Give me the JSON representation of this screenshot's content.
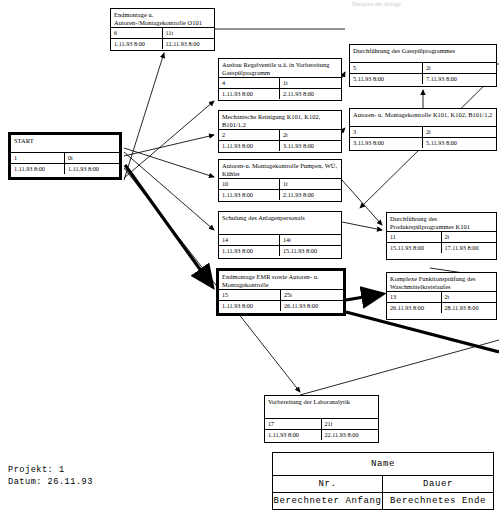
{
  "page": {
    "top_note": "Netzplan der Anlage",
    "project_label": "Projekt: 1",
    "date_label": "Datum: 26.11.93"
  },
  "legend": {
    "name": "Name",
    "nr": "Nr.",
    "dauer": "Dauer",
    "start": "Berechneter Anfang",
    "end": "Berechnetes Ende"
  },
  "nodes": [
    {
      "id": "start",
      "name": "START",
      "nr": "1",
      "dauer": "0t",
      "start": "1.11.93 8:00",
      "end": "1.11.93 8:00",
      "bold": true,
      "x": 8,
      "y": 132,
      "w": 114,
      "h": 48
    },
    {
      "id": "endmontage-o101",
      "name": "Endmontage u. Autoren-/Montagekontrolle O101",
      "nr": "6",
      "dauer": "11t",
      "start": "1.11.93 8:00",
      "end": "12.11.93 8:00",
      "bold": false,
      "x": 110,
      "y": 8,
      "w": 105,
      "h": 43
    },
    {
      "id": "ausbau-regelventile",
      "name": "Ausbau Regelventile u.ä. in Vorbereitung Gasspülprogramm",
      "nr": "4",
      "dauer": "1t",
      "start": "1.11.93 8:00",
      "end": "2.11.93 8:00",
      "bold": false,
      "x": 218,
      "y": 58,
      "w": 124,
      "h": 43
    },
    {
      "id": "mech-reinigung",
      "name": "Mechanische Reinigung K101, K102, B101/1,2",
      "nr": "2",
      "dauer": "2t",
      "start": "1.11.93 8:00",
      "end": "3.11.93 8:00",
      "bold": false,
      "x": 218,
      "y": 110,
      "w": 124,
      "h": 43
    },
    {
      "id": "autoren-pumpen",
      "name": "Autoren-u. Montagekontrolle Pumpen, WÜ, Kühler",
      "nr": "10",
      "dauer": "1t",
      "start": "1.11.93 8:00",
      "end": "2.11.93 8:00",
      "bold": false,
      "x": 218,
      "y": 159,
      "w": 124,
      "h": 43
    },
    {
      "id": "schulung",
      "name": "Schulung des Anlagenpersonals",
      "nr": "14",
      "dauer": "14t",
      "start": "1.11.93 8:00",
      "end": "15.11.93 8:00",
      "bold": false,
      "x": 218,
      "y": 211,
      "w": 124,
      "h": 48
    },
    {
      "id": "endmontage-emr",
      "name": "Endmontage EMR sowie Autoren- u. Montagekontrolle",
      "nr": "15",
      "dauer": "25t",
      "start": "1.11.93 8:00",
      "end": "26.11.93 8:00",
      "bold": true,
      "x": 216,
      "y": 268,
      "w": 130,
      "h": 48
    },
    {
      "id": "vorbereitung-labor",
      "name": "Vorbereitung der Laboranalytik",
      "nr": "17",
      "dauer": "21t",
      "start": "1.11.93 8:00",
      "end": "22.11.93 8:00",
      "bold": false,
      "x": 264,
      "y": 395,
      "w": 115,
      "h": 48
    },
    {
      "id": "durchf-gasspuel",
      "name": "Durchführung des Gasspülprogrammes",
      "nr": "5",
      "dauer": "2t",
      "start": "5.11.93 8:00",
      "end": "7.11.93 8:00",
      "bold": false,
      "x": 349,
      "y": 44,
      "w": 148,
      "h": 43
    },
    {
      "id": "autoren-k101",
      "name": "Autoren- u. Montagekontrolle K101, K102, B101/1,2",
      "nr": "3",
      "dauer": "2t",
      "start": "3.11.93 8:00",
      "end": "5.11.93 8:00",
      "bold": false,
      "x": 349,
      "y": 108,
      "w": 148,
      "h": 43
    },
    {
      "id": "durchf-produktspuel",
      "name": "Durchführung des Produktspülprogrammes K101",
      "nr": "11",
      "dauer": "2t",
      "start": "15.11.93 8:00",
      "end": "17.11.93 8:00",
      "bold": false,
      "x": 386,
      "y": 212,
      "w": 111,
      "h": 48
    },
    {
      "id": "komplexe-pruefung",
      "name": "Komplexe Funktionsprüfung des Waschmittelkreislaufes",
      "nr": "13",
      "dauer": "2t",
      "start": "26.11.93 8:00",
      "end": "28.11.93 8:00",
      "bold": false,
      "x": 386,
      "y": 272,
      "w": 111,
      "h": 48
    }
  ],
  "arrows": [
    {
      "name": "start-to-endmontage-o101",
      "d": "M124,180 L164,53",
      "bold": false,
      "head": true
    },
    {
      "name": "start-to-ausbau",
      "d": "M124,178 L214,101",
      "bold": false,
      "head": true
    },
    {
      "name": "start-to-mech-reinigung",
      "d": "M124,156 L214,135",
      "bold": false,
      "head": true
    },
    {
      "name": "start-to-autoren-pumpen",
      "d": "M124,148 L214,177",
      "bold": false,
      "head": true
    },
    {
      "name": "start-to-schulung",
      "d": "M124,152 L214,230",
      "bold": false,
      "head": true
    },
    {
      "name": "start-to-endmontage-emr",
      "d": "M125,165 L212,286",
      "bold": true,
      "head": true
    },
    {
      "name": "start-to-vorbereitung-labor",
      "d": "M124,168 L300,392",
      "bold": false,
      "head": true
    },
    {
      "name": "ausbau-to-durchf-gasspuel",
      "d": "M342,78 L345,72",
      "bold": false,
      "head": true
    },
    {
      "name": "mech-to-autoren-k101",
      "d": "M342,131 L345,128",
      "bold": false,
      "head": true
    },
    {
      "name": "autoren-k101-to-gasspuel",
      "d": "M423,108 L423,90",
      "bold": false,
      "head": true
    },
    {
      "name": "schulung-to-produktspuel",
      "d": "M342,222 L382,230",
      "bold": false,
      "head": true
    },
    {
      "name": "autoren-pumpen-to-produkt",
      "d": "M342,180 L382,225",
      "bold": false,
      "head": true
    },
    {
      "name": "gasspuel-to-produktspuel",
      "d": "M497,73 L360,208",
      "bold": false,
      "head": true
    },
    {
      "name": "endmontage-emr-to-komplexe",
      "d": "M346,300 L382,294",
      "bold": true,
      "head": true
    },
    {
      "name": "komplexe-out-right",
      "d": "M497,278 L430,268",
      "bold": false,
      "head": false
    },
    {
      "name": "emr-long-right",
      "d": "M346,312 L499,352",
      "bold": true,
      "head": false
    },
    {
      "name": "labor-long-right",
      "d": "M300,395 L499,340",
      "bold": false,
      "head": false
    },
    {
      "name": "gasspuel-out-right-a",
      "d": "M497,64 L499,64",
      "bold": false,
      "head": false
    },
    {
      "name": "endmontage-o101-out-right",
      "d": "M215,29 L345,29",
      "bold": false,
      "head": false
    }
  ]
}
